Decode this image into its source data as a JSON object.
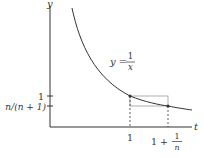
{
  "figure": {
    "axes": {
      "x_label": "t",
      "y_label": "y"
    },
    "curve": {
      "equation_lhs": "y =",
      "equation_num": "1",
      "equation_den": "x"
    },
    "y_ticks": [
      {
        "label": "1"
      },
      {
        "label": "n/(n + 1)"
      }
    ],
    "x_ticks": [
      {
        "label": "1"
      },
      {
        "label_main": "1 +",
        "label_num": "1",
        "label_den": "n"
      }
    ],
    "colors": {
      "curve": "#333333",
      "axes": "#333333",
      "rectangle": "#999999"
    }
  }
}
